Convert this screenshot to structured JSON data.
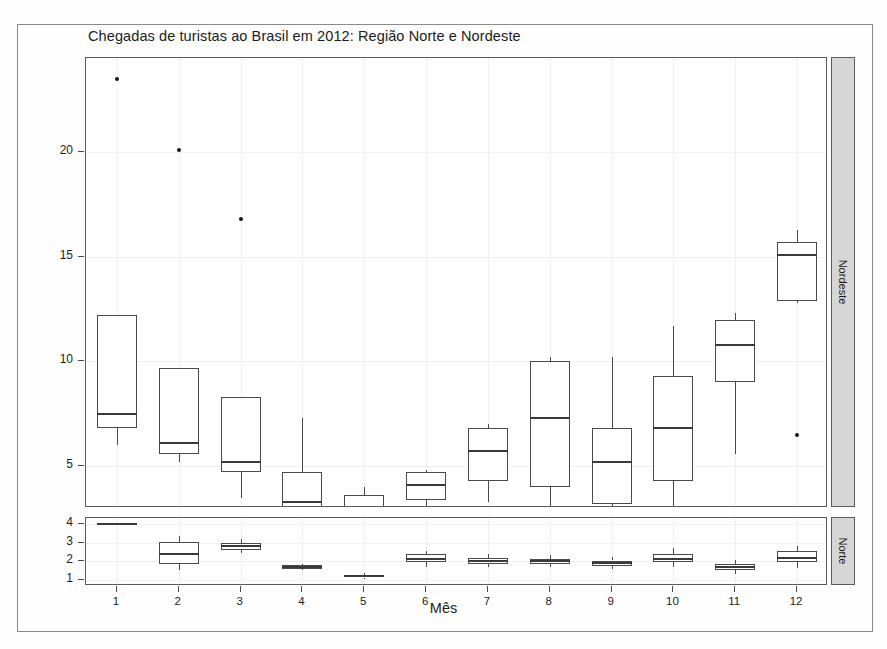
{
  "chart_data": {
    "type": "box",
    "title": "Chegadas de turistas ao Brasil em 2012: Região Norte e Nordeste",
    "xlabel": "Mês",
    "ylabel": "Chegadas por mil",
    "grid": true,
    "legend_position": "none",
    "panels": [
      {
        "name": "Nordeste",
        "strip_label": "Nordeste",
        "ylim": [
          3.0,
          24.5
        ],
        "yticks": [
          5,
          10,
          15,
          20
        ],
        "ytick_labels": [
          "5",
          "10",
          "15",
          "20"
        ],
        "categories": [
          "1",
          "2",
          "3",
          "4",
          "5",
          "6",
          "7",
          "8",
          "9",
          "10",
          "11",
          "12"
        ],
        "boxes": [
          {
            "x": "1",
            "whisker_low": 6.0,
            "q1": 6.8,
            "median": 7.5,
            "q3": 12.2,
            "whisker_high": 12.2,
            "outliers": [
              23.5
            ]
          },
          {
            "x": "2",
            "whisker_low": 5.2,
            "q1": 5.6,
            "median": 6.1,
            "q3": 9.7,
            "whisker_high": 9.7,
            "outliers": [
              20.1
            ]
          },
          {
            "x": "3",
            "whisker_low": 3.5,
            "q1": 4.7,
            "median": 5.2,
            "q3": 8.3,
            "whisker_high": 8.3,
            "outliers": [
              16.8
            ]
          },
          {
            "x": "4",
            "whisker_low": 1.7,
            "q1": 2.8,
            "median": 3.3,
            "q3": 4.7,
            "whisker_high": 7.3,
            "outliers": []
          },
          {
            "x": "5",
            "whisker_low": 1.5,
            "q1": 2.2,
            "median": 2.7,
            "q3": 3.6,
            "whisker_high": 4.0,
            "outliers": []
          },
          {
            "x": "6",
            "whisker_low": 1.4,
            "q1": 3.4,
            "median": 4.1,
            "q3": 4.7,
            "whisker_high": 4.8,
            "outliers": []
          },
          {
            "x": "7",
            "whisker_low": 3.3,
            "q1": 4.3,
            "median": 5.7,
            "q3": 6.8,
            "whisker_high": 7.0,
            "outliers": []
          },
          {
            "x": "8",
            "whisker_low": 2.7,
            "q1": 4.0,
            "median": 7.3,
            "q3": 10.0,
            "whisker_high": 10.2,
            "outliers": []
          },
          {
            "x": "9",
            "whisker_low": 1.7,
            "q1": 3.2,
            "median": 5.2,
            "q3": 6.8,
            "whisker_high": 10.2,
            "outliers": []
          },
          {
            "x": "10",
            "whisker_low": 2.8,
            "q1": 4.3,
            "median": 6.8,
            "q3": 9.3,
            "whisker_high": 11.7,
            "outliers": []
          },
          {
            "x": "11",
            "whisker_low": 5.6,
            "q1": 9.0,
            "median": 10.8,
            "q3": 12.0,
            "whisker_high": 12.3,
            "outliers": []
          },
          {
            "x": "12",
            "whisker_low": 12.8,
            "q1": 12.9,
            "median": 15.1,
            "q3": 15.7,
            "whisker_high": 16.3,
            "outliers": [
              6.5
            ]
          }
        ]
      },
      {
        "name": "Norte",
        "strip_label": "Norte",
        "ylim": [
          0.7,
          4.3
        ],
        "yticks": [
          1,
          2,
          3,
          4
        ],
        "ytick_labels": [
          "1",
          "2",
          "3",
          "4"
        ],
        "categories": [
          "1",
          "2",
          "3",
          "4",
          "5",
          "6",
          "7",
          "8",
          "9",
          "10",
          "11",
          "12"
        ],
        "boxes": [
          {
            "x": "1",
            "whisker_low": 3.95,
            "q1": 3.97,
            "median": 4.0,
            "q3": 4.02,
            "whisker_high": 4.05,
            "outliers": []
          },
          {
            "x": "2",
            "whisker_low": 1.55,
            "q1": 1.85,
            "median": 2.4,
            "q3": 3.05,
            "whisker_high": 3.35,
            "outliers": []
          },
          {
            "x": "3",
            "whisker_low": 2.45,
            "q1": 2.6,
            "median": 2.8,
            "q3": 3.0,
            "whisker_high": 3.2,
            "outliers": []
          },
          {
            "x": "4",
            "whisker_low": 1.55,
            "q1": 1.62,
            "median": 1.7,
            "q3": 1.8,
            "whisker_high": 1.88,
            "outliers": []
          },
          {
            "x": "5",
            "whisker_low": 1.05,
            "q1": 1.15,
            "median": 1.22,
            "q3": 1.3,
            "whisker_high": 1.38,
            "outliers": []
          },
          {
            "x": "6",
            "whisker_low": 1.7,
            "q1": 1.95,
            "median": 2.15,
            "q3": 2.4,
            "whisker_high": 2.55,
            "outliers": []
          },
          {
            "x": "7",
            "whisker_low": 1.7,
            "q1": 1.85,
            "median": 2.0,
            "q3": 2.2,
            "whisker_high": 2.4,
            "outliers": []
          },
          {
            "x": "8",
            "whisker_low": 1.72,
            "q1": 1.88,
            "median": 2.0,
            "q3": 2.15,
            "whisker_high": 2.32,
            "outliers": []
          },
          {
            "x": "9",
            "whisker_low": 1.6,
            "q1": 1.78,
            "median": 1.9,
            "q3": 2.05,
            "whisker_high": 2.22,
            "outliers": []
          },
          {
            "x": "10",
            "whisker_low": 1.7,
            "q1": 1.95,
            "median": 2.15,
            "q3": 2.4,
            "whisker_high": 2.7,
            "outliers": []
          },
          {
            "x": "11",
            "whisker_low": 1.35,
            "q1": 1.55,
            "median": 1.68,
            "q3": 1.85,
            "whisker_high": 2.1,
            "outliers": []
          },
          {
            "x": "12",
            "whisker_low": 1.65,
            "q1": 1.95,
            "median": 2.2,
            "q3": 2.55,
            "whisker_high": 2.8,
            "outliers": []
          }
        ]
      }
    ]
  }
}
